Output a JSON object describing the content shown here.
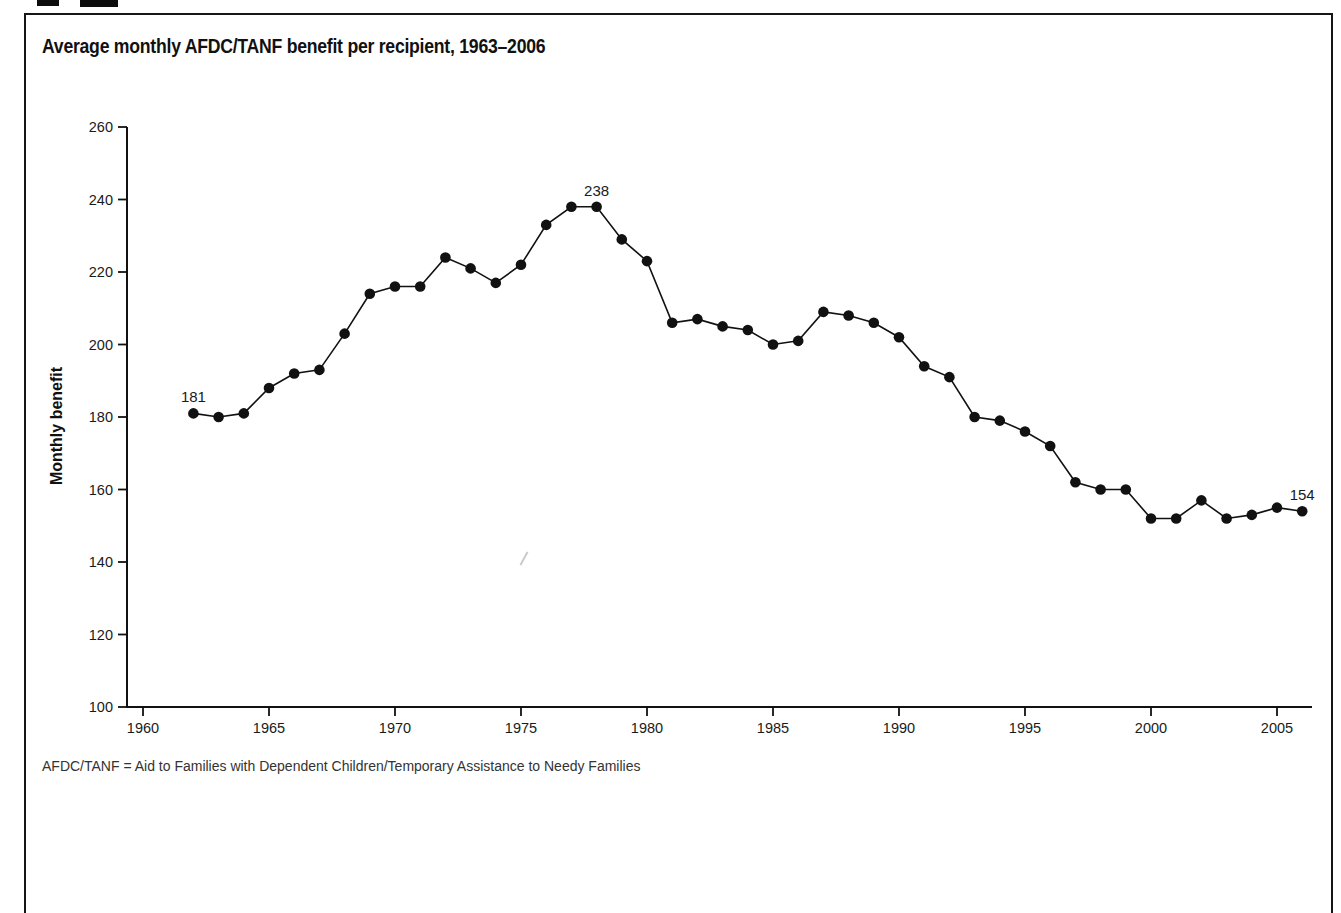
{
  "figure": {
    "title": "Average monthly AFDC/TANF benefit per recipient, 1963–2006",
    "footnote": "AFDC/TANF = Aid to Families with Dependent Children/Temporary Assistance to Needy Families"
  },
  "chart_data": {
    "type": "line",
    "title": "Average monthly AFDC/TANF benefit per recipient, 1963–2006",
    "xlabel": "",
    "ylabel": "Monthly benefit",
    "ylim": [
      100,
      260
    ],
    "yticks": [
      100,
      120,
      140,
      160,
      180,
      200,
      220,
      240,
      260
    ],
    "xticks": [
      1960,
      1965,
      1970,
      1975,
      1980,
      1985,
      1990,
      1995,
      2000,
      2005
    ],
    "grid": false,
    "legend": "none",
    "line_color": "#111111",
    "marker": "filled-circle",
    "x": [
      1962,
      1963,
      1964,
      1965,
      1966,
      1967,
      1968,
      1969,
      1970,
      1971,
      1972,
      1973,
      1974,
      1975,
      1976,
      1977,
      1978,
      1979,
      1980,
      1981,
      1982,
      1983,
      1984,
      1985,
      1986,
      1987,
      1988,
      1989,
      1990,
      1991,
      1992,
      1993,
      1994,
      1995,
      1996,
      1997,
      1998,
      1999,
      2000,
      2001,
      2002,
      2003,
      2004,
      2005,
      2006
    ],
    "values": [
      181,
      180,
      181,
      188,
      192,
      193,
      203,
      214,
      216,
      216,
      224,
      221,
      217,
      222,
      233,
      238,
      238,
      229,
      223,
      206,
      207,
      205,
      204,
      200,
      201,
      209,
      208,
      206,
      202,
      194,
      191,
      180,
      179,
      176,
      172,
      162,
      160,
      160,
      152,
      152,
      157,
      152,
      153,
      155,
      154
    ],
    "annotations": [
      {
        "x": 1962,
        "value": 181,
        "label": "181"
      },
      {
        "x": 1978,
        "value": 238,
        "label": "238"
      },
      {
        "x": 2006,
        "value": 154,
        "label": "154"
      }
    ]
  }
}
